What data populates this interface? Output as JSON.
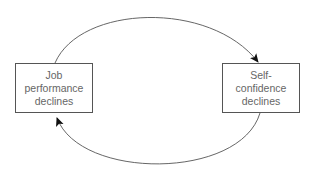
{
  "diagram": {
    "type": "cycle",
    "nodes": [
      {
        "id": "job",
        "lines": [
          "Job",
          "performance",
          "declines"
        ]
      },
      {
        "id": "self",
        "lines": [
          "Self-",
          "confidence",
          "declines"
        ]
      }
    ],
    "edges": [
      {
        "from": "job",
        "to": "self",
        "path": "top-arc"
      },
      {
        "from": "self",
        "to": "job",
        "path": "bottom-arc"
      }
    ],
    "colors": {
      "line": "#555555",
      "arrowhead": "#111111",
      "text": "#666666"
    }
  }
}
